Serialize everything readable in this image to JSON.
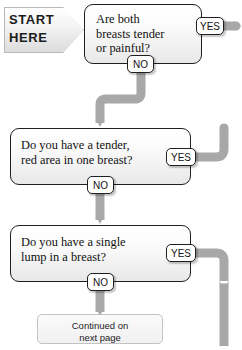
{
  "flowchart": {
    "title": "Breast symptoms decision flowchart",
    "colors": {
      "connector": "#a8a8a8",
      "box_border": "#1f1f1f",
      "box_fill": "#f2f2f2",
      "badge_fill": "#ffffff",
      "text": "#111111"
    },
    "start": {
      "line1": "START",
      "line2": "HERE",
      "shape": "pentagon-arrow"
    },
    "questions": [
      {
        "id": "q1",
        "text": "Are both\nbreasts tender\nor painful?",
        "yes_label": "YES",
        "no_label": "NO"
      },
      {
        "id": "q2",
        "text": "Do you have a tender,\nred area in one breast?",
        "yes_label": "YES",
        "no_label": "NO"
      },
      {
        "id": "q3",
        "text": "Do you have a single\nlump in a breast?",
        "yes_label": "YES",
        "no_label": "NO"
      }
    ],
    "terminal": {
      "text": "Continued on\nnext page"
    }
  }
}
